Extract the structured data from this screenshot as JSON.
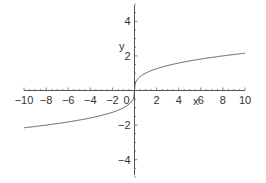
{
  "chart_data": {
    "type": "line",
    "title": "",
    "xlabel": "x",
    "ylabel": "y",
    "xlim": [
      -10,
      10
    ],
    "ylim": [
      -5,
      5
    ],
    "grid": false,
    "x_ticks": [
      -10,
      -8,
      -6,
      -4,
      -2,
      0,
      2,
      4,
      6,
      8,
      10
    ],
    "y_ticks": [
      -4,
      -2,
      2,
      4
    ],
    "x_tick_labels": [
      "−10",
      "−8",
      "−6",
      "−4",
      "−2",
      "0",
      "2",
      "4",
      "6",
      "8",
      "10"
    ],
    "y_tick_labels": [
      "−4",
      "−2",
      "2",
      "4"
    ],
    "series": [
      {
        "name": "y = x^(1/3)",
        "x": [
          -10,
          -8,
          -6,
          -4,
          -2,
          -1,
          -0.5,
          -0.1,
          0,
          0.1,
          0.5,
          1,
          2,
          4,
          6,
          8,
          10
        ],
        "y": [
          -2.154,
          -2,
          -1.817,
          -1.587,
          -1.26,
          -1,
          -0.794,
          -0.464,
          0,
          0.464,
          0.794,
          1,
          1.26,
          1.587,
          1.817,
          2,
          2.154
        ]
      }
    ]
  }
}
